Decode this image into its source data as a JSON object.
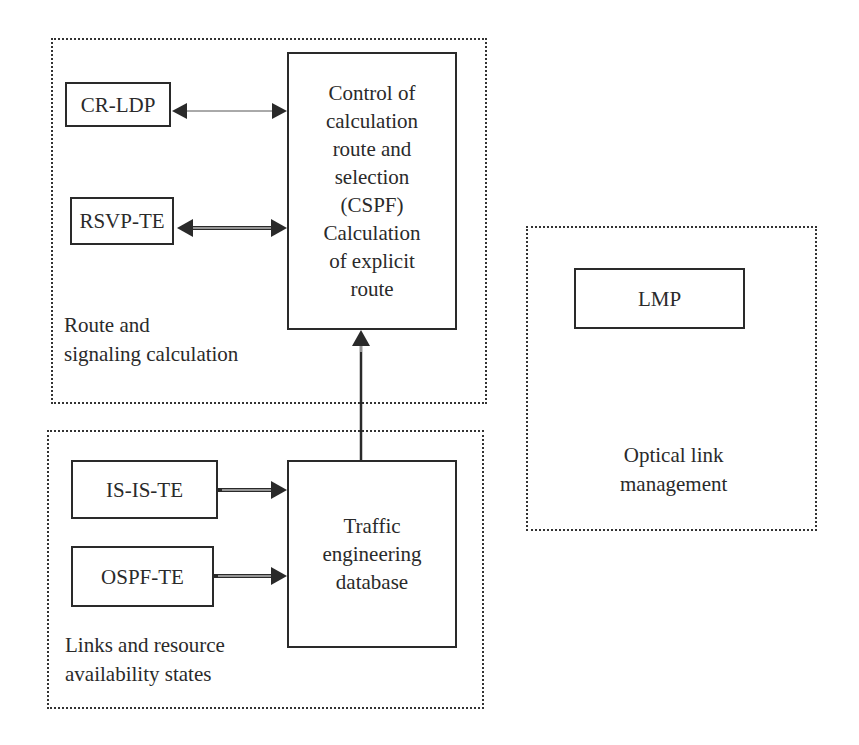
{
  "groups": {
    "route": {
      "label": "Route and\nsignaling calculation"
    },
    "links": {
      "label": "Links and resource\navailability states"
    },
    "optical": {
      "label": "Optical link\nmanagement"
    }
  },
  "nodes": {
    "cr_ldp": "CR-LDP",
    "rsvp_te": "RSVP-TE",
    "cspf": "Control of\ncalculation\nroute and\nselection\n(CSPF)\nCalculation\nof explicit\nroute",
    "is_is_te": "IS-IS-TE",
    "ospf_te": "OSPF-TE",
    "ted": "Traffic\nengineering\ndatabase",
    "lmp": "LMP"
  },
  "edges": [
    {
      "from": "cr_ldp",
      "to": "cspf",
      "type": "bidirectional-thin"
    },
    {
      "from": "rsvp_te",
      "to": "cspf",
      "type": "bidirectional-double"
    },
    {
      "from": "is_is_te",
      "to": "ted",
      "type": "directed-double"
    },
    {
      "from": "ospf_te",
      "to": "ted",
      "type": "directed-double"
    },
    {
      "from": "ted",
      "to": "cspf",
      "type": "directed-double"
    }
  ],
  "colors": {
    "stroke": "#2a2a2a",
    "background": "#ffffff"
  }
}
